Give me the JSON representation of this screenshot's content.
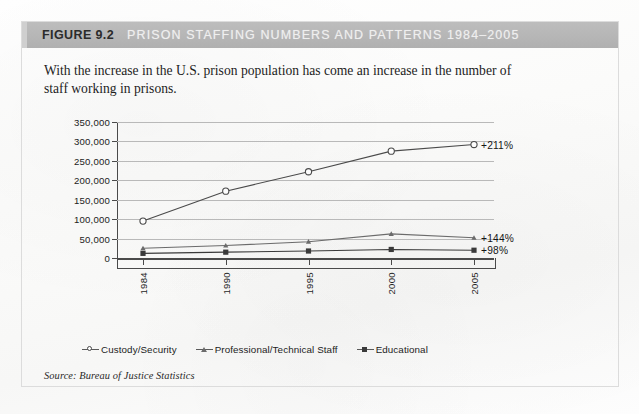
{
  "figure": {
    "number_label": "FIGURE 9.2",
    "title": "PRISON STAFFING NUMBERS AND PATTERNS 1984–2005",
    "caption": "With the increase in the U.S. prison population has come an increase in the number of staff working in prisons.",
    "source": "Source: Bureau of Justice Statistics",
    "header_bg": "#b6b6b6",
    "header_title_color": "#efefef",
    "header_number_color": "#2b2b2b"
  },
  "chart_data": {
    "type": "line",
    "title": "PRISON STAFFING NUMBERS AND PATTERNS 1984–2005",
    "xlabel": "",
    "ylabel": "",
    "categories": [
      "1984",
      "1990",
      "1995",
      "2000",
      "2005"
    ],
    "ylim": [
      0,
      350000
    ],
    "ytick_values": [
      0,
      50000,
      100000,
      150000,
      200000,
      250000,
      300000,
      350000
    ],
    "ytick_labels": [
      "0",
      "50,000",
      "100,000",
      "150,000",
      "200,000",
      "250,000",
      "300,000",
      "350,000"
    ],
    "grid": true,
    "legend_position": "bottom",
    "series": [
      {
        "name": "Custody/Security",
        "marker": "circle-hollow",
        "color": "#4a4a4a",
        "values": [
          95000,
          172000,
          222000,
          275000,
          292000
        ],
        "annotation": "+211%"
      },
      {
        "name": "Professional/Technical Staff",
        "marker": "triangle",
        "color": "#6b6b6b",
        "values": [
          25000,
          32000,
          42000,
          62000,
          52000
        ],
        "annotation": "+144%"
      },
      {
        "name": "Educational",
        "marker": "square-filled",
        "color": "#3a3a3a",
        "values": [
          12000,
          15000,
          18000,
          22000,
          20000
        ],
        "annotation": "+98%"
      }
    ]
  }
}
